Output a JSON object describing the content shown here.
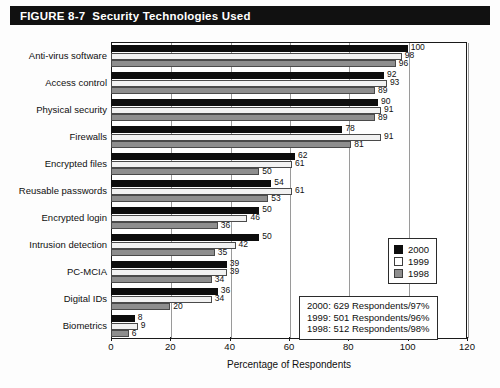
{
  "figure": {
    "number": "FIGURE 8-7",
    "title": "Security Technologies Used"
  },
  "legend": {
    "items": [
      {
        "label": "2000",
        "color": "#0d0d0d",
        "swatch": "y2000"
      },
      {
        "label": "1999",
        "color": "#ffffff",
        "swatch": "y1999"
      },
      {
        "label": "1998",
        "color": "#8e8e8e",
        "swatch": "y1998"
      }
    ]
  },
  "note": {
    "lines": [
      "2000:  629 Respondents/97%",
      "1999:  501 Respondents/96%",
      "1998:  512 Respondents/98%"
    ]
  },
  "chart_data": {
    "type": "bar",
    "orientation": "horizontal",
    "title": "Security Technologies Used",
    "xlabel": "Percentage of Respondents",
    "ylabel": "",
    "xlim": [
      0,
      120
    ],
    "xticks": [
      0,
      20,
      40,
      60,
      80,
      100,
      120
    ],
    "grid": true,
    "legend_position": "right",
    "categories": [
      "Anti-virus software",
      "Access control",
      "Physical security",
      "Firewalls",
      "Encrypted files",
      "Reusable passwords",
      "Encrypted login",
      "Intrusion detection",
      "PC-MCIA",
      "Digital IDs",
      "Biometrics"
    ],
    "series": [
      {
        "name": "2000",
        "color": "#0d0d0d",
        "values": [
          100,
          92,
          90,
          78,
          62,
          54,
          50,
          50,
          39,
          36,
          8
        ]
      },
      {
        "name": "1999",
        "color": "#ffffff",
        "values": [
          98,
          93,
          91,
          91,
          61,
          61,
          46,
          42,
          39,
          34,
          9
        ]
      },
      {
        "name": "1998",
        "color": "#8e8e8e",
        "values": [
          96,
          89,
          89,
          81,
          50,
          53,
          36,
          35,
          34,
          20,
          6
        ]
      }
    ]
  }
}
